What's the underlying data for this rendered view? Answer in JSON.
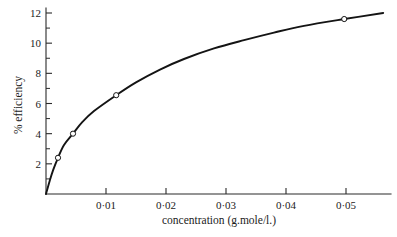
{
  "figure": {
    "background_color": "#ffffff",
    "line_color": "#141414",
    "axis_color": "#2a2a2a",
    "marker_face_color": "#ffffff"
  },
  "chart_data": {
    "type": "line",
    "title": "",
    "xlabel": "concentration (g.mole/l.)",
    "ylabel": "% efficiency",
    "xlim": [
      0,
      0.0562
    ],
    "ylim": [
      0,
      12.5
    ],
    "grid": false,
    "legend": "none",
    "x_ticks": [
      0.01,
      0.02,
      0.03,
      0.04,
      0.05
    ],
    "x_tick_labels": [
      "0·01",
      "0·02",
      "0·03",
      "0·04",
      "0·05"
    ],
    "y_ticks": [
      2,
      4,
      6,
      8,
      10,
      12
    ],
    "y_tick_labels": [
      "2",
      "4",
      "6",
      "8",
      "10",
      "12"
    ],
    "y_minor_ticks": [
      1,
      3,
      5,
      7,
      9,
      11
    ],
    "x_minor_ticks": [],
    "series": [
      {
        "name": "% efficiency vs concentration",
        "marker": "open-circle",
        "x": [
          0.0,
          0.002,
          0.0045,
          0.0117,
          0.0497
        ],
        "y": [
          0.0,
          2.4,
          4.0,
          6.55,
          11.6
        ],
        "curve_x": [
          0.0,
          0.0006,
          0.0012,
          0.002,
          0.003,
          0.0045,
          0.006,
          0.008,
          0.0117,
          0.015,
          0.019,
          0.023,
          0.028,
          0.033,
          0.038,
          0.043,
          0.0497,
          0.0562
        ],
        "curve_y": [
          0.0,
          0.85,
          1.6,
          2.4,
          3.25,
          4.0,
          4.75,
          5.5,
          6.55,
          7.4,
          8.25,
          8.95,
          9.65,
          10.2,
          10.7,
          11.15,
          11.6,
          12.0
        ]
      }
    ],
    "data_points": [
      {
        "x": 0.002,
        "y": 2.4
      },
      {
        "x": 0.0045,
        "y": 4.0
      },
      {
        "x": 0.0117,
        "y": 6.55
      },
      {
        "x": 0.0497,
        "y": 11.6
      }
    ]
  }
}
